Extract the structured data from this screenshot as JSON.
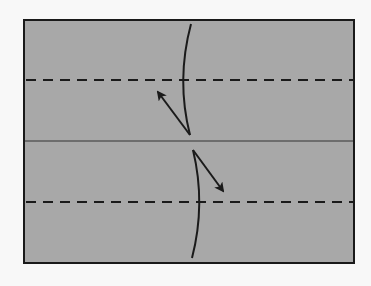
{
  "diagram": {
    "type": "origami-fold-step",
    "colors": {
      "background": "#f8f8f8",
      "paper": "#a8a8a8",
      "stroke": "#1a1a1a"
    },
    "paper": {
      "x": 24,
      "y": 20,
      "width": 330,
      "height": 243
    },
    "center_line_y": 141,
    "valley_folds_y": [
      80,
      202
    ],
    "arrows": [
      {
        "name": "upper-fold-arrow",
        "direction": "up-left"
      },
      {
        "name": "lower-fold-arrow",
        "direction": "down-right"
      }
    ]
  }
}
